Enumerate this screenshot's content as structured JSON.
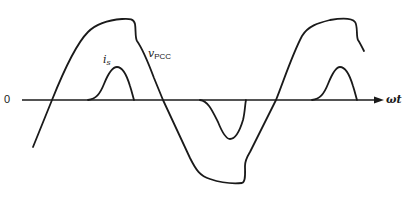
{
  "diagram": {
    "axis": {
      "origin_label": "0",
      "x_label": "ωt"
    },
    "curves": [
      {
        "name": "v_PCC",
        "label_main": "v",
        "label_sub": "PCC",
        "description": "flat-topped (clipped) distorted voltage waveform at point of common coupling"
      },
      {
        "name": "i_s",
        "label_main": "i",
        "label_sub": "s",
        "description": "pulsed source current drawn near voltage peaks"
      }
    ],
    "colors": {
      "stroke": "#1a1a1a",
      "background": "#ffffff"
    }
  }
}
